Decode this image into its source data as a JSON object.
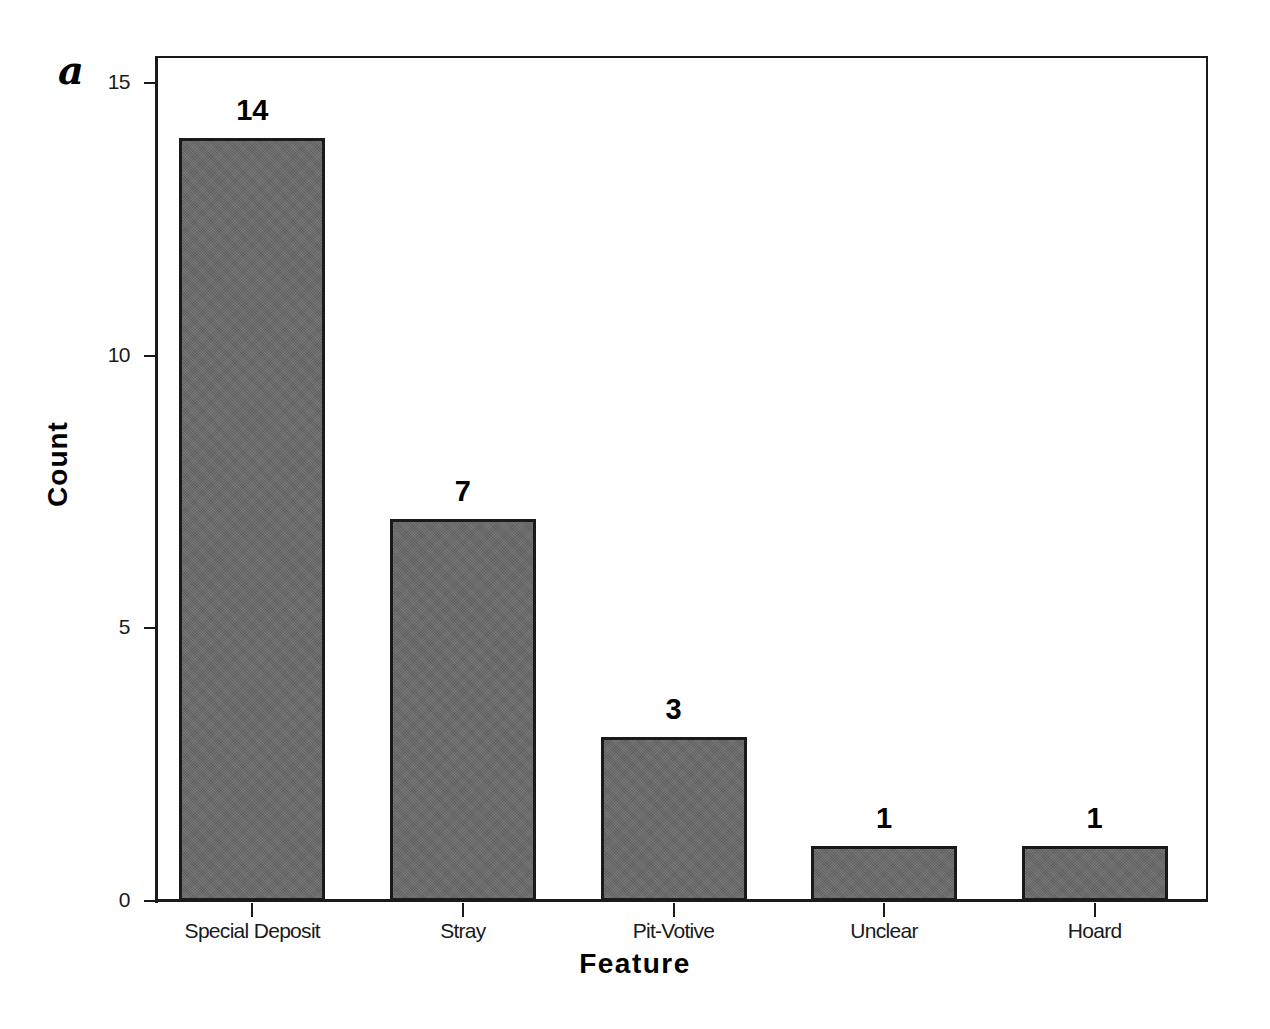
{
  "figure": {
    "panel_label": "a",
    "background_color": "#ffffff",
    "axis_color": "#1a1a1a",
    "bar_fill_color": "#6a6a6a",
    "bar_edge_color": "#1a1a1a"
  },
  "chart_data": {
    "type": "bar",
    "title": "",
    "subtitle": "",
    "xlabel": "Feature",
    "ylabel": "Count",
    "categories": [
      "Special Deposit",
      "Stray",
      "Pit-Votive",
      "Unclear",
      "Hoard"
    ],
    "values": [
      14,
      7,
      3,
      1,
      1
    ],
    "data_labels": [
      "14",
      "7",
      "3",
      "1",
      "1"
    ],
    "ylim": [
      0,
      15.5
    ],
    "yticks": [
      0,
      5,
      10,
      15
    ],
    "ytick_labels": [
      "0",
      "5",
      "10",
      "15"
    ],
    "grid": false,
    "legend": null,
    "legend_position": "none",
    "annotations": [
      "a"
    ],
    "series": [
      {
        "name": "Count",
        "values": [
          14,
          7,
          3,
          1,
          1
        ]
      }
    ]
  }
}
